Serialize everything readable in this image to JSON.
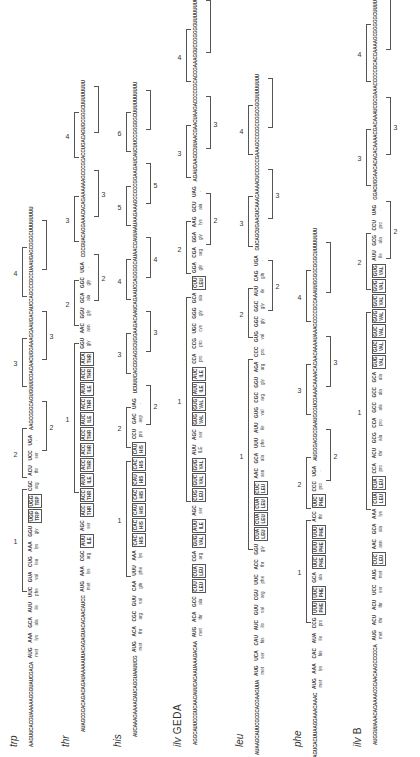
{
  "figure": {
    "orientation": "rotated-90-ccw",
    "rows": [
      {
        "id": "trp",
        "label": "trp",
        "leader_5prime": "AAGUUCACGUAAAAAGGGUAUCGACA",
        "codons": [
          "AUG",
          "AAA",
          "GCA",
          "AUU",
          "UUC",
          "GUA",
          "CUG",
          "AAA",
          "GGU",
          "UGG",
          "UGG",
          "CGC",
          "ACU",
          "UCC",
          "UGA"
        ],
        "amino_acids": [
          "met",
          "lys",
          "ala",
          "ile",
          "phe",
          "val",
          "leu",
          "lys",
          "gly",
          "TRP",
          "TRP",
          "arg",
          "thr",
          "ser",
          "·"
        ],
        "boxed": [
          9,
          10
        ],
        "trailer_3prime": "AAGCGGGCAGUGUUUCGACAACUGGAAAGCAAUGACAUCCAGCCCGCCUAAUGAGCGGGCUUUUUUUU",
        "region_labels": [
          "1",
          "2",
          "2",
          "3",
          "3",
          "4"
        ]
      },
      {
        "id": "thr",
        "label": "thr",
        "leader_5prime": "AUAGCGCACAGACAGAUAAAAAUUACAGAGUACACAACAUCC",
        "codons": [
          "AUG",
          "AAA",
          "CGC",
          "AUU",
          "AGC",
          "ACC",
          "ACC",
          "AUU",
          "ACC",
          "ACC",
          "ACC",
          "AUC",
          "ACC",
          "AUU",
          "ACC",
          "ACA",
          "GGU",
          "AAC",
          "GGU",
          "GCA",
          "GGC",
          "UGA"
        ],
        "amino_acids": [
          "met",
          "lys",
          "arg",
          "ILE",
          "ser",
          "THR",
          "THR",
          "ILE",
          "THR",
          "THR",
          "THR",
          "ILE",
          "THR",
          "ILE",
          "THR",
          "THR",
          "gly",
          "asn",
          "gly",
          "ala",
          "gly",
          "·"
        ],
        "boxed": [
          3,
          5,
          6,
          7,
          8,
          9,
          10,
          11,
          12,
          13,
          14,
          15
        ],
        "trailer_3prime": "CGCGUACAGGAAACACAGAAAAAAGCCCGCACCUGACAGUGCGGGCUUUUUUUU",
        "region_labels": [
          "1",
          "2",
          "2",
          "3",
          "3",
          "4"
        ]
      },
      {
        "id": "his",
        "label": "his",
        "leader_5prime": "AUCAAAGAAAACAUCAGGUAAUUCG",
        "codons": [
          "AUG",
          "ACA",
          "CGC",
          "GUU",
          "CAA",
          "UUU",
          "AAA",
          "CAC",
          "CAC",
          "CAU",
          "CAC",
          "CAU",
          "CAC",
          "CAU",
          "CCU",
          "GAC",
          "UAG"
        ],
        "amino_acids": [
          "met",
          "thr",
          "arg",
          "val",
          "gln",
          "phe",
          "lys",
          "HIS",
          "HIS",
          "HIS",
          "HIS",
          "HIS",
          "HIS",
          "HIS",
          "pro",
          "asp",
          "·"
        ],
        "boxed": [
          7,
          8,
          9,
          10,
          11,
          12,
          13
        ],
        "trailer_3prime": "UCUUUCAGCGGAGGCUGGAAGACAAUCAGAAUCCAGGGGCAUAACCAUUAAUAAGAAAGCCCCCGGAAGAUCAUCUUCCGGGGGCUUUUUUUUUU",
        "region_labels": [
          "1",
          "2",
          "2",
          "3",
          "3",
          "4",
          "4",
          "5",
          "5",
          "6"
        ]
      },
      {
        "id": "ilv-geda",
        "label": "ilv",
        "label_suffix": "GEDA",
        "leader_5prime": "AGGCAUUCCGUCAACAUUCACAAUAAAGACAA",
        "codons": [
          "AUG",
          "ACA",
          "GCC",
          "CUU",
          "CUA",
          "CGA",
          "GUG",
          "AUU",
          "AGC",
          "CUG",
          "GUC",
          "GUG",
          "AUU",
          "AGC",
          "GUG",
          "GUG",
          "AUU",
          "AUC",
          "CCA",
          "CCG",
          "UGC",
          "GGG",
          "GCA",
          "CUU",
          "GGA",
          "CGA",
          "GGA",
          "AAG",
          "GCU",
          "UAG"
        ],
        "amino_acids": [
          "met",
          "thr",
          "ala",
          "LEU",
          "LEU",
          "arg",
          "VAL",
          "ILE",
          "ser",
          "LEU",
          "VAL",
          "VAL",
          "ILE",
          "ser",
          "VAL",
          "VAL",
          "ILE",
          "ILE",
          "pro",
          "pro",
          "cys",
          "gly",
          "ala",
          "LEU",
          "gly",
          "arg",
          "gly",
          "lys",
          "ala",
          "·"
        ],
        "boxed": [
          3,
          4,
          6,
          7,
          9,
          10,
          11,
          14,
          15,
          16,
          17,
          23
        ],
        "trailer_3prime": "AGAUCAAGCCUUAACGAACUAAGACCCCCGCACCGAAAGGUCCGGGGGUUUUUUUU",
        "region_labels": [
          "1",
          "2",
          "2",
          "3",
          "3",
          "4"
        ]
      },
      {
        "id": "leu",
        "label": "leu",
        "leader_5prime": "AUAAGCAUUCGCGCACGAAGUUA",
        "codons": [
          "AUG",
          "UCA",
          "CAU",
          "AUC",
          "GUU",
          "CGU",
          "UUC",
          "ACC",
          "GGU",
          "CUA",
          "CUA",
          "CUA",
          "CUC",
          "AAC",
          "GCA",
          "UUU",
          "AUU",
          "GUG",
          "CGC",
          "GGU",
          "AGA",
          "CCC",
          "GUG",
          "GGC",
          "GGC",
          "AUU",
          "CAG",
          "UGA"
        ],
        "amino_acids": [
          "met",
          "ser",
          "his",
          "ile",
          "val",
          "arg",
          "phe",
          "thr",
          "gly",
          "LEU",
          "LEU",
          "LEU",
          "LEU",
          "asn",
          "ala",
          "phe",
          "ile",
          "val",
          "arg",
          "gly",
          "arg",
          "pro",
          "val",
          "gly",
          "gly",
          "ile",
          "gln",
          "·"
        ],
        "boxed": [
          9,
          10,
          11,
          12
        ],
        "trailer_3prime": "GUCAGCUGAAGUCAAACAAAACUCCCCCGAAAGCCCCGCCGGCGGCUUUUUUUU",
        "region_labels": [
          "1",
          "2",
          "2",
          "3",
          "3",
          "4"
        ]
      },
      {
        "id": "phe",
        "label": "phe",
        "leader_5prime": "AAGUCACUUAAGGAAACAAAC",
        "codons": [
          "AUG",
          "AAA",
          "CAC",
          "AUA",
          "CCG",
          "UUU",
          "UUC",
          "GCA",
          "UUC",
          "UUU",
          "UUU",
          "ACC",
          "UUC",
          "CCC",
          "UGA"
        ],
        "amino_acids": [
          "met",
          "lys",
          "his",
          "ile",
          "pro",
          "PHE",
          "PHE",
          "ala",
          "PHE",
          "PHE",
          "PHE",
          "thr",
          "PHE",
          "pro",
          "·"
        ],
        "boxed": [
          5,
          6,
          8,
          9,
          10,
          12
        ],
        "trailer_3prime": "AUGGGAGGCGAAUGCGUCGAAACAAAACACAACAAAAUAAAGCCCCGCCAAAUUGGGGCGGGCUUUUUUUU",
        "region_labels": [
          "1",
          "2",
          "2",
          "3",
          "3",
          "4"
        ]
      },
      {
        "id": "ilv-b",
        "label": "ilv",
        "label_suffix": "B",
        "leader_5prime": "AUGGUUAAACACAAAACGCAACAAGCCCCCA",
        "codons": [
          "AUG",
          "ACU",
          "ACU",
          "UCC",
          "AUG",
          "CUC",
          "AAC",
          "GCA",
          "AAA",
          "CUA",
          "CUA",
          "CCA",
          "ACU",
          "GCG",
          "CCA",
          "GCC",
          "GCC",
          "GCA",
          "GUG",
          "GUC",
          "GUC",
          "GUG",
          "GUC",
          "GUG",
          "GUG",
          "AUU",
          "GCG",
          "CCU",
          "UAG"
        ],
        "amino_acids": [
          "met",
          "thr",
          "thr",
          "ser",
          "met",
          "LEU",
          "asn",
          "ala",
          "lys",
          "LEU",
          "LEU",
          "pro",
          "thr",
          "ala",
          "pro",
          "ala",
          "ala",
          "ala",
          "VAL",
          "VAL",
          "VAL",
          "VAL",
          "VAL",
          "VAL",
          "VAL",
          "ile",
          "ala",
          "pro",
          "·"
        ],
        "boxed": [
          5,
          9,
          10,
          18,
          19,
          20,
          21,
          22,
          23,
          24
        ],
        "trailer_3prime": "GGACUGGAACACACACAAAACGACAAAUCGCGAAACCCCCGCACCAAAAGCGGGGGCUUUUUUUU",
        "region_labels": [
          "1",
          "2",
          "2",
          "3",
          "3",
          "4"
        ]
      }
    ]
  }
}
